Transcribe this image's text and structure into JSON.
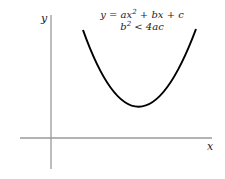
{
  "diagram": {
    "axis_labels": {
      "x": "x",
      "y": "y"
    },
    "equation": {
      "line1": {
        "prefix": "y = ax",
        "exp": "2",
        "suffix": " + bx + c"
      },
      "line2": {
        "prefix": "b",
        "exp": "2",
        "suffix": " < 4ac"
      }
    },
    "colors": {
      "axis": "#9a9a9a",
      "curve": "#000000",
      "text": "#222222"
    },
    "curve": {
      "type": "parabola",
      "opens": "up",
      "vertex": [
        138,
        107
      ],
      "left_end": [
        83,
        30
      ],
      "right_end": [
        196,
        29
      ]
    }
  }
}
